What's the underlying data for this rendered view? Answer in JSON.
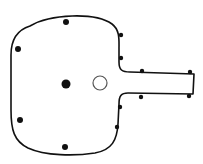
{
  "diagram": {
    "colors": {
      "stroke": "#111111",
      "fill": "#ffffff",
      "background": "#ffffff"
    },
    "outline": {
      "stroke_width": 1.6
    },
    "large_dot": {
      "x": 66,
      "y": 84,
      "r": 4.5
    },
    "open_circle": {
      "x": 100,
      "y": 83,
      "r": 7
    },
    "interior_dots": [
      {
        "x": 66,
        "y": 22,
        "r": 3
      },
      {
        "x": 18,
        "y": 49,
        "r": 3
      },
      {
        "x": 20,
        "y": 120,
        "r": 3
      },
      {
        "x": 65,
        "y": 147,
        "r": 3
      }
    ],
    "edge_dots": [
      {
        "x": 121,
        "y": 35,
        "r": 2.2
      },
      {
        "x": 121,
        "y": 58,
        "r": 2.2
      },
      {
        "x": 142,
        "y": 71,
        "r": 2.2
      },
      {
        "x": 190,
        "y": 72,
        "r": 2.2
      },
      {
        "x": 141,
        "y": 97,
        "r": 2.2
      },
      {
        "x": 189,
        "y": 96,
        "r": 2.2
      },
      {
        "x": 120,
        "y": 107,
        "r": 2.2
      },
      {
        "x": 117,
        "y": 127,
        "r": 2.2
      }
    ]
  }
}
